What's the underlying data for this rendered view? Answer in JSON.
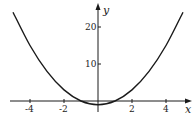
{
  "chart_data": {
    "type": "line",
    "title": "",
    "xlabel": "x",
    "ylabel": "y",
    "function": "y = x^2 - 1",
    "xlim": [
      -5,
      5
    ],
    "ylim": [
      -2,
      25
    ],
    "x_ticks": [
      -4,
      -2,
      2,
      4
    ],
    "x_tick_labels": [
      "-4",
      "-2",
      "2",
      "4"
    ],
    "y_ticks": [
      10,
      20
    ],
    "y_tick_labels": [
      "10",
      "20"
    ],
    "grid": false,
    "legend": null,
    "series": [
      {
        "name": "curve",
        "x": [
          -5,
          -4,
          -3,
          -2,
          -1,
          0,
          1,
          2,
          3,
          4,
          5
        ],
        "values": [
          24,
          15,
          8,
          3,
          0,
          -1,
          0,
          3,
          8,
          15,
          24
        ]
      }
    ],
    "colors": {
      "curve": "#1a1a1a",
      "axis": "#1a1a1a"
    }
  }
}
